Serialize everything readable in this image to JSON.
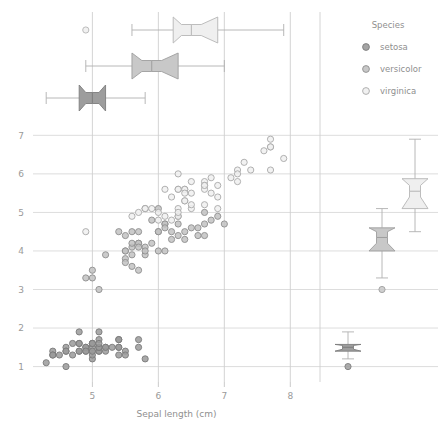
{
  "chart_data": {
    "type": "scatter",
    "title": "",
    "xlabel": "Sepal length (cm)",
    "ylabel": "",
    "xlim": [
      4.1,
      8.45
    ],
    "ylim": [
      0.6,
      7.45
    ],
    "xticks": [
      5,
      6,
      7,
      8
    ],
    "yticks": [
      1,
      2,
      3,
      4,
      5,
      6,
      7
    ],
    "grid": true,
    "legend": {
      "title": "Species",
      "position": "top-right",
      "entries": [
        {
          "label": "setosa",
          "marker": "circle",
          "fill": "#9a9a9a",
          "stroke": "#7d7d7d"
        },
        {
          "label": "versicolor",
          "marker": "circle",
          "fill": "#c2c2c2",
          "stroke": "#8e8e8e"
        },
        {
          "label": "virginica",
          "marker": "circle",
          "fill": "#f0f0f0",
          "stroke": "#a8a8a8"
        }
      ]
    },
    "series": [
      {
        "name": "setosa",
        "fill": "#9a9a9a",
        "stroke": "#7a7a7a",
        "points": [
          [
            5.1,
            1.4
          ],
          [
            4.9,
            1.4
          ],
          [
            4.7,
            1.3
          ],
          [
            4.6,
            1.5
          ],
          [
            5.0,
            1.4
          ],
          [
            5.4,
            1.7
          ],
          [
            4.6,
            1.4
          ],
          [
            5.0,
            1.5
          ],
          [
            4.4,
            1.4
          ],
          [
            4.9,
            1.5
          ],
          [
            5.4,
            1.5
          ],
          [
            4.8,
            1.6
          ],
          [
            4.8,
            1.4
          ],
          [
            4.3,
            1.1
          ],
          [
            5.8,
            1.2
          ],
          [
            5.7,
            1.5
          ],
          [
            5.4,
            1.3
          ],
          [
            5.1,
            1.4
          ],
          [
            5.7,
            1.7
          ],
          [
            5.1,
            1.5
          ],
          [
            5.4,
            1.7
          ],
          [
            5.1,
            1.5
          ],
          [
            4.6,
            1.0
          ],
          [
            5.1,
            1.7
          ],
          [
            4.8,
            1.9
          ],
          [
            5.0,
            1.6
          ],
          [
            5.0,
            1.6
          ],
          [
            5.2,
            1.5
          ],
          [
            5.2,
            1.4
          ],
          [
            4.7,
            1.6
          ],
          [
            4.8,
            1.6
          ],
          [
            5.4,
            1.5
          ],
          [
            5.2,
            1.5
          ],
          [
            5.5,
            1.4
          ],
          [
            4.9,
            1.5
          ],
          [
            5.0,
            1.2
          ],
          [
            5.5,
            1.3
          ],
          [
            4.9,
            1.4
          ],
          [
            4.4,
            1.3
          ],
          [
            5.1,
            1.5
          ],
          [
            5.0,
            1.3
          ],
          [
            4.5,
            1.3
          ],
          [
            4.4,
            1.3
          ],
          [
            5.0,
            1.6
          ],
          [
            5.1,
            1.9
          ],
          [
            4.8,
            1.4
          ],
          [
            5.1,
            1.6
          ],
          [
            4.6,
            1.4
          ],
          [
            5.3,
            1.5
          ],
          [
            5.0,
            1.4
          ]
        ]
      },
      {
        "name": "versicolor",
        "fill": "#c2c2c2",
        "stroke": "#8e8e8e",
        "points": [
          [
            7.0,
            4.7
          ],
          [
            6.4,
            4.5
          ],
          [
            6.9,
            4.9
          ],
          [
            5.5,
            4.0
          ],
          [
            6.5,
            4.6
          ],
          [
            5.7,
            4.5
          ],
          [
            6.3,
            4.7
          ],
          [
            4.9,
            3.3
          ],
          [
            6.6,
            4.6
          ],
          [
            5.2,
            3.9
          ],
          [
            5.0,
            3.5
          ],
          [
            5.9,
            4.2
          ],
          [
            6.0,
            4.0
          ],
          [
            6.1,
            4.7
          ],
          [
            5.6,
            3.6
          ],
          [
            6.7,
            4.4
          ],
          [
            5.6,
            4.5
          ],
          [
            5.8,
            4.1
          ],
          [
            6.2,
            4.5
          ],
          [
            5.6,
            3.9
          ],
          [
            5.9,
            4.8
          ],
          [
            6.1,
            4.0
          ],
          [
            6.3,
            4.9
          ],
          [
            6.1,
            4.7
          ],
          [
            6.4,
            4.3
          ],
          [
            6.6,
            4.4
          ],
          [
            6.8,
            4.8
          ],
          [
            6.7,
            5.0
          ],
          [
            6.0,
            4.5
          ],
          [
            5.7,
            3.5
          ],
          [
            5.5,
            3.8
          ],
          [
            5.5,
            3.7
          ],
          [
            5.8,
            3.9
          ],
          [
            6.0,
            5.1
          ],
          [
            5.4,
            4.5
          ],
          [
            6.0,
            4.5
          ],
          [
            6.7,
            4.7
          ],
          [
            6.3,
            4.4
          ],
          [
            5.6,
            4.1
          ],
          [
            5.5,
            4.0
          ],
          [
            5.5,
            4.4
          ],
          [
            6.1,
            4.6
          ],
          [
            5.8,
            4.0
          ],
          [
            5.0,
            3.3
          ],
          [
            5.6,
            4.2
          ],
          [
            5.7,
            4.2
          ],
          [
            5.7,
            4.2
          ],
          [
            6.2,
            4.3
          ],
          [
            5.1,
            3.0
          ],
          [
            5.7,
            4.1
          ]
        ]
      },
      {
        "name": "virginica",
        "fill": "#f0f0f0",
        "stroke": "#a8a8a8",
        "points": [
          [
            6.3,
            6.0
          ],
          [
            5.8,
            5.1
          ],
          [
            7.1,
            5.9
          ],
          [
            6.3,
            5.6
          ],
          [
            6.5,
            5.8
          ],
          [
            7.6,
            6.6
          ],
          [
            4.9,
            4.5
          ],
          [
            7.3,
            6.3
          ],
          [
            6.7,
            5.8
          ],
          [
            7.2,
            6.1
          ],
          [
            6.5,
            5.1
          ],
          [
            6.4,
            5.3
          ],
          [
            6.8,
            5.5
          ],
          [
            5.7,
            5.0
          ],
          [
            5.8,
            5.1
          ],
          [
            6.4,
            5.3
          ],
          [
            6.5,
            5.5
          ],
          [
            7.7,
            6.7
          ],
          [
            7.7,
            6.9
          ],
          [
            6.0,
            5.0
          ],
          [
            6.9,
            5.7
          ],
          [
            5.6,
            4.9
          ],
          [
            7.7,
            6.7
          ],
          [
            6.3,
            4.9
          ],
          [
            6.7,
            5.7
          ],
          [
            7.2,
            6.0
          ],
          [
            6.2,
            4.8
          ],
          [
            6.1,
            4.9
          ],
          [
            6.4,
            5.6
          ],
          [
            7.2,
            5.8
          ],
          [
            7.4,
            6.1
          ],
          [
            7.9,
            6.4
          ],
          [
            6.4,
            5.6
          ],
          [
            6.3,
            5.1
          ],
          [
            6.1,
            5.6
          ],
          [
            7.7,
            6.1
          ],
          [
            6.3,
            5.6
          ],
          [
            6.4,
            5.5
          ],
          [
            6.0,
            4.8
          ],
          [
            6.9,
            5.4
          ],
          [
            6.7,
            5.6
          ],
          [
            6.9,
            5.1
          ],
          [
            5.8,
            5.1
          ],
          [
            6.8,
            5.9
          ],
          [
            6.7,
            5.7
          ],
          [
            6.7,
            5.2
          ],
          [
            6.3,
            5.0
          ],
          [
            6.5,
            5.2
          ],
          [
            6.2,
            5.4
          ],
          [
            5.9,
            5.1
          ]
        ]
      }
    ],
    "top_boxplots": {
      "orientation": "horizontal",
      "variable": "Sepal length (cm)",
      "notched": true,
      "boxes": [
        {
          "name": "virginica",
          "row": 0,
          "fill": "#efefef",
          "stroke": "#b5b5b5",
          "whisker_low": 5.6,
          "q1": 6.225,
          "median": 6.5,
          "q3": 6.9,
          "whisker_high": 7.9,
          "notch_low": 6.35,
          "notch_high": 6.65,
          "outliers": [
            4.9
          ]
        },
        {
          "name": "versicolor",
          "row": 1,
          "fill": "#c8c8c8",
          "stroke": "#9e9e9e",
          "whisker_low": 4.9,
          "q1": 5.6,
          "median": 5.9,
          "q3": 6.3,
          "whisker_high": 7.0,
          "notch_low": 5.75,
          "notch_high": 6.05,
          "outliers": []
        },
        {
          "name": "setosa",
          "row": 2,
          "fill": "#9d9d9d",
          "stroke": "#7e7e7e",
          "whisker_low": 4.3,
          "q1": 4.8,
          "median": 5.0,
          "q3": 5.2,
          "whisker_high": 5.8,
          "notch_low": 4.9,
          "notch_high": 5.1,
          "outliers": []
        }
      ]
    },
    "right_boxplots": {
      "orientation": "vertical",
      "variable": "Petal length (cm)",
      "notched": true,
      "boxes": [
        {
          "name": "setosa",
          "col": 0,
          "fill": "#9d9d9d",
          "stroke": "#7e7e7e",
          "whisker_low": 1.2,
          "q1": 1.4,
          "median": 1.5,
          "q3": 1.575,
          "whisker_high": 1.9,
          "notch_low": 1.45,
          "notch_high": 1.55,
          "outliers": [
            1.0
          ]
        },
        {
          "name": "versicolor",
          "col": 1,
          "fill": "#c8c8c8",
          "stroke": "#9e9e9e",
          "whisker_low": 3.3,
          "q1": 4.0,
          "median": 4.35,
          "q3": 4.6,
          "whisker_high": 5.1,
          "notch_low": 4.2,
          "notch_high": 4.5,
          "outliers": [
            3.0
          ]
        },
        {
          "name": "virginica",
          "col": 2,
          "fill": "#efefef",
          "stroke": "#b5b5b5",
          "whisker_low": 4.5,
          "q1": 5.1,
          "median": 5.55,
          "q3": 5.875,
          "whisker_high": 6.9,
          "notch_low": 5.4,
          "notch_high": 5.7,
          "outliers": []
        }
      ]
    }
  },
  "axis": {
    "x_title": "Sepal length (cm)",
    "x_tick_labels": [
      "5",
      "6",
      "7",
      "8"
    ],
    "y_tick_labels": [
      "7",
      "6",
      "5",
      "4",
      "3",
      "2",
      "1"
    ]
  },
  "legend": {
    "title": "Species",
    "items": [
      "setosa",
      "versicolor",
      "virginica"
    ]
  }
}
